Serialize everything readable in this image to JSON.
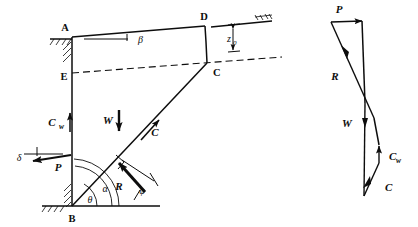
{
  "figure": {
    "ink_color": "#0d0d0d",
    "background": "#ffffff"
  },
  "wall_diagram": {
    "name": "free-body-diagram",
    "points": {
      "A": "A",
      "B": "B",
      "C": "C",
      "D": "D",
      "E": "E"
    },
    "angles": {
      "beta": "β",
      "theta": "θ",
      "alpha": "α",
      "phi": "φ",
      "delta": "δ"
    },
    "forces": {
      "P": "P",
      "W": "W",
      "C": "C",
      "Cw_main": "C",
      "Cw_sub": "w",
      "R": "R"
    },
    "dimensions": {
      "z0_main": "z",
      "z0_sub": "0"
    }
  },
  "force_polygon": {
    "name": "force-polygon",
    "labels": {
      "P": "P",
      "R": "R",
      "W": "W",
      "Cw_main": "C",
      "Cw_sub": "w",
      "C": "C"
    }
  }
}
